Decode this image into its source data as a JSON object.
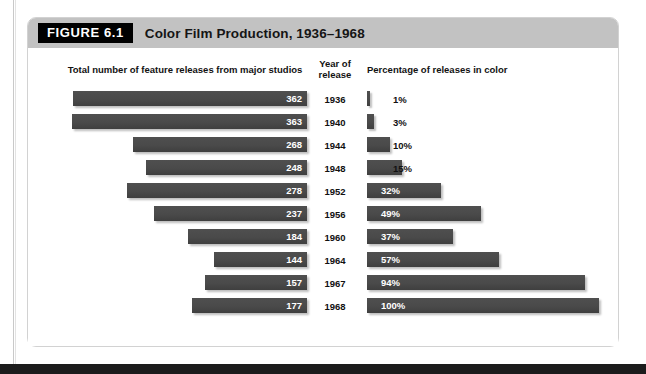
{
  "figure": {
    "number_label": "FIGURE 6.1",
    "title": "Color Film Production, 1936–1968"
  },
  "columns": {
    "left_header": "Total number of feature releases from major studios",
    "year_header": "Year of\nrelease",
    "year_header_line1": "Year of",
    "year_header_line2": "release",
    "right_header": "Percentage of releases in color"
  },
  "colors": {
    "bar": "#4a4a4a",
    "header_band": "#c2c2c2",
    "figure_number_bg": "#000000",
    "panel_border": "#d2d2d2",
    "text": "#111111",
    "bar_label": "#ffffff"
  },
  "chart_data": {
    "type": "bar",
    "title": "Color Film Production, 1936–1968",
    "orientation": "horizontal",
    "layout": "paired bidirectional bars sharing a year axis",
    "categories": [
      "1936",
      "1940",
      "1944",
      "1948",
      "1952",
      "1956",
      "1960",
      "1964",
      "1967",
      "1968"
    ],
    "xlabel": "",
    "ylabel": "Year of release",
    "grid": false,
    "legend": "none",
    "series": [
      {
        "name": "Total number of feature releases from major studios",
        "side": "left",
        "direction": "right-to-left",
        "unit": "releases",
        "values": [
          362,
          363,
          268,
          248,
          278,
          237,
          184,
          144,
          157,
          177
        ],
        "labels": [
          "362",
          "363",
          "268",
          "248",
          "278",
          "237",
          "184",
          "144",
          "157",
          "177"
        ],
        "axis_max": 400,
        "label_position": "inside-end"
      },
      {
        "name": "Percentage of releases in color",
        "side": "right",
        "direction": "left-to-right",
        "unit": "%",
        "values": [
          1,
          3,
          10,
          15,
          32,
          49,
          37,
          57,
          94,
          100
        ],
        "labels": [
          "1%",
          "3%",
          "10%",
          "15%",
          "32%",
          "49%",
          "37%",
          "57%",
          "94%",
          "100%"
        ],
        "axis_max": 100,
        "label_position": "inside-start for >=32%, outside for <=15%"
      }
    ],
    "rows": [
      {
        "year": "1936",
        "releases": 362,
        "releases_label": "362",
        "percent": 1,
        "percent_label": "1%"
      },
      {
        "year": "1940",
        "releases": 363,
        "releases_label": "363",
        "percent": 3,
        "percent_label": "3%"
      },
      {
        "year": "1944",
        "releases": 268,
        "releases_label": "268",
        "percent": 10,
        "percent_label": "10%"
      },
      {
        "year": "1948",
        "releases": 248,
        "releases_label": "248",
        "percent": 15,
        "percent_label": "15%"
      },
      {
        "year": "1952",
        "releases": 278,
        "releases_label": "278",
        "percent": 32,
        "percent_label": "32%"
      },
      {
        "year": "1956",
        "releases": 237,
        "releases_label": "237",
        "percent": 49,
        "percent_label": "49%"
      },
      {
        "year": "1960",
        "releases": 184,
        "releases_label": "184",
        "percent": 37,
        "percent_label": "37%"
      },
      {
        "year": "1964",
        "releases": 144,
        "releases_label": "144",
        "percent": 57,
        "percent_label": "57%"
      },
      {
        "year": "1967",
        "releases": 157,
        "releases_label": "157",
        "percent": 94,
        "percent_label": "94%"
      },
      {
        "year": "1968",
        "releases": 177,
        "releases_label": "177",
        "percent": 100,
        "percent_label": "100%"
      }
    ]
  }
}
